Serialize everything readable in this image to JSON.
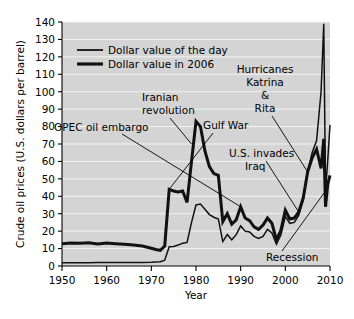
{
  "chart_data": {
    "type": "line",
    "title": "",
    "xlabel": "Year",
    "ylabel": "Crude oil prices (U.S. dollars per barrel)",
    "xlim": [
      1950,
      2010
    ],
    "ylim": [
      0,
      140
    ],
    "xticks": [
      1950,
      1960,
      1970,
      1980,
      1990,
      2000,
      2010
    ],
    "xticklabels": [
      "1950",
      "1960",
      "1970",
      "1980",
      "1990",
      "2000",
      "2010"
    ],
    "yticks": [
      0,
      10,
      20,
      30,
      40,
      50,
      60,
      70,
      80,
      90,
      100,
      110,
      120,
      130,
      140
    ],
    "yticklabels": [
      "0",
      "10",
      "20",
      "30",
      "40",
      "50",
      "60",
      "70",
      "80",
      "90",
      "100",
      "110",
      "120",
      "130",
      "140"
    ],
    "grid": true,
    "grid_color": "#f2f2f2",
    "plot_background": "#d4d4d4",
    "legend_position": "upper-left",
    "series": [
      {
        "name": "Dollar value of the day",
        "style": "thin",
        "x": [
          1950,
          1952,
          1954,
          1956,
          1958,
          1960,
          1962,
          1964,
          1966,
          1968,
          1970,
          1971,
          1972,
          1973,
          1974,
          1975,
          1976,
          1977,
          1978,
          1979,
          1980,
          1981,
          1982,
          1983,
          1984,
          1985,
          1986,
          1987,
          1988,
          1989,
          1990,
          1991,
          1992,
          1993,
          1994,
          1995,
          1996,
          1997,
          1998,
          1999,
          2000,
          2001,
          2002,
          2003,
          2004,
          2005,
          2006,
          2007,
          2008,
          2008.6,
          2009,
          2009.5,
          2010
        ],
        "values": [
          1.8,
          1.9,
          1.9,
          1.9,
          2.0,
          2.0,
          2.0,
          2.0,
          2.0,
          2.0,
          2.1,
          2.3,
          2.5,
          3.3,
          11.0,
          11.2,
          12.0,
          13.0,
          13.5,
          25.0,
          35.0,
          35.5,
          32.5,
          29.5,
          28.0,
          27.0,
          14.0,
          18.0,
          15.0,
          18.0,
          23.0,
          20.0,
          19.5,
          17.0,
          15.8,
          17.0,
          21.0,
          19.0,
          12.5,
          17.8,
          28.5,
          24.5,
          25.0,
          29.0,
          38.0,
          54.0,
          65.0,
          72.0,
          100.0,
          139.0,
          43.0,
          61.0,
          81.0
        ]
      },
      {
        "name": "Dollar value in 2006",
        "style": "thick",
        "x": [
          1950,
          1952,
          1954,
          1956,
          1958,
          1960,
          1962,
          1964,
          1966,
          1968,
          1970,
          1971,
          1972,
          1973,
          1974,
          1975,
          1976,
          1977,
          1978,
          1979,
          1980,
          1981,
          1982,
          1983,
          1984,
          1985,
          1986,
          1987,
          1988,
          1989,
          1990,
          1991,
          1992,
          1993,
          1994,
          1995,
          1996,
          1997,
          1998,
          1999,
          2000,
          2001,
          2002,
          2003,
          2004,
          2005,
          2006,
          2007,
          2008,
          2008.6,
          2009,
          2009.5,
          2010
        ],
        "values": [
          12.8,
          13.2,
          13.0,
          13.4,
          12.6,
          13.2,
          12.8,
          12.5,
          12.0,
          11.5,
          10.2,
          9.5,
          9.0,
          11.5,
          44.0,
          43.0,
          42.5,
          43.0,
          36.5,
          60.0,
          83.0,
          80.0,
          66.0,
          57.0,
          53.0,
          52.0,
          25.5,
          30.0,
          24.0,
          26.5,
          34.0,
          27.5,
          26.0,
          22.5,
          21.0,
          23.5,
          27.5,
          24.5,
          15.0,
          20.5,
          32.0,
          27.0,
          27.5,
          31.0,
          39.0,
          54.0,
          62.0,
          67.0,
          56.0,
          73.0,
          34.0,
          47.0,
          52.0
        ]
      }
    ],
    "annotations": [
      {
        "label": "OPEC oil embargo",
        "lines": [
          "OPEC oil embargo"
        ],
        "anchor_year": 1974,
        "anchor_value": 44
      },
      {
        "label": "Iranian revolution",
        "lines": [
          "Iranian",
          "revolution"
        ],
        "anchor_year": 1979,
        "anchor_value": 70
      },
      {
        "label": "Gulf War",
        "lines": [
          "Gulf War"
        ],
        "anchor_year": 1990,
        "anchor_value": 34
      },
      {
        "label": "Hurricanes Katrina & Rita",
        "lines": [
          "Hurricanes",
          "Katrina",
          "&",
          "Rita"
        ],
        "anchor_year": 2005,
        "anchor_value": 54
      },
      {
        "label": "U.S. invades Iraq",
        "lines": [
          "U.S. invades",
          "Iraq"
        ],
        "anchor_year": 2003,
        "anchor_value": 31
      },
      {
        "label": "Recession",
        "lines": [
          "Recession"
        ],
        "anchor_year": 2009,
        "anchor_value": 43
      }
    ]
  },
  "legend": {
    "items": [
      {
        "label": "Dollar value of the day"
      },
      {
        "label": "Dollar value in 2006"
      }
    ]
  },
  "axes": {
    "x_title": "Year",
    "y_title": "Crude oil prices (U.S. dollars per barrel)"
  }
}
